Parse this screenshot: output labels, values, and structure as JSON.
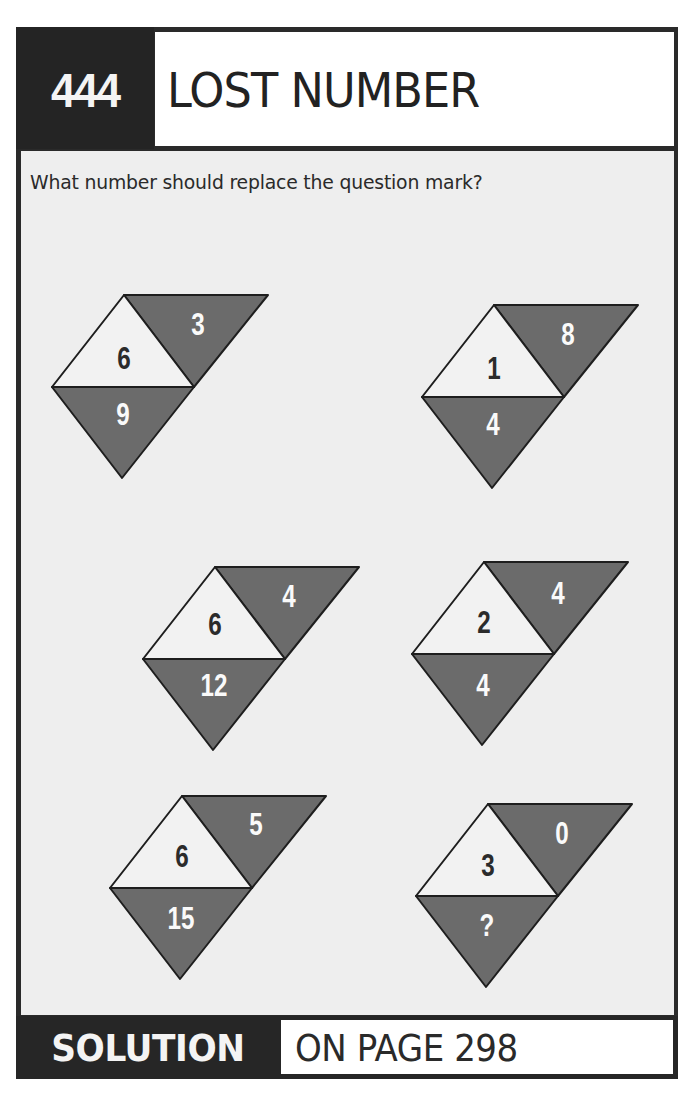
{
  "header": {
    "puzzle_number": "444",
    "title": "LOST NUMBER"
  },
  "question": "What number should replace the question mark?",
  "colors": {
    "frame": "#262626",
    "body_bg": "#eeeeee",
    "light_triangle": "#f2f2f2",
    "dark_triangle": "#6b6b6b",
    "outline": "#1e1e1e"
  },
  "figures": [
    {
      "center": "6",
      "top_right": "3",
      "bottom": "9"
    },
    {
      "center": "1",
      "top_right": "8",
      "bottom": "4"
    },
    {
      "center": "6",
      "top_right": "4",
      "bottom": "12"
    },
    {
      "center": "2",
      "top_right": "4",
      "bottom": "4"
    },
    {
      "center": "6",
      "top_right": "5",
      "bottom": "15"
    },
    {
      "center": "3",
      "top_right": "0",
      "bottom": "?"
    }
  ],
  "footer": {
    "label": "SOLUTION",
    "reference": "ON PAGE 298"
  }
}
